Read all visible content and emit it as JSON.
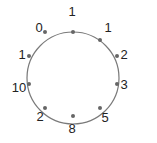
{
  "diagram": {
    "type": "circle-of-nodes",
    "center": [
      73,
      78
    ],
    "radius": 46,
    "stroke_color": "#7a7a7a",
    "node_color": "#666666",
    "label_color": "#222222",
    "nodes": [
      {
        "label": "1",
        "x": 73,
        "y": 32,
        "lx": 72,
        "ly": 16
      },
      {
        "label": "1",
        "x": 100,
        "y": 40,
        "lx": 108,
        "ly": 32
      },
      {
        "label": "2",
        "x": 117,
        "y": 56,
        "lx": 124,
        "ly": 59
      },
      {
        "label": "3",
        "x": 117,
        "y": 84,
        "lx": 124,
        "ly": 89
      },
      {
        "label": "5",
        "x": 100,
        "y": 108,
        "lx": 105,
        "ly": 122
      },
      {
        "label": "8",
        "x": 73,
        "y": 116,
        "lx": 72,
        "ly": 133
      },
      {
        "label": "2",
        "x": 45,
        "y": 108,
        "lx": 40,
        "ly": 121
      },
      {
        "label": "10",
        "x": 29,
        "y": 84,
        "lx": 19,
        "ly": 92
      },
      {
        "label": "1",
        "x": 29,
        "y": 56,
        "lx": 22,
        "ly": 59
      },
      {
        "label": "0",
        "x": 45,
        "y": 32,
        "lx": 39,
        "ly": 32
      }
    ]
  }
}
